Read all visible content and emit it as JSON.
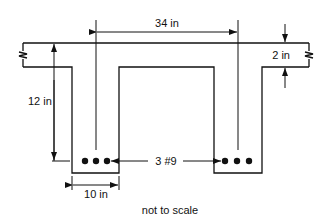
{
  "diagram": {
    "type": "T-beam cross-section",
    "labels": {
      "center_spacing": "34 in",
      "flange_thickness": "2 in",
      "total_depth": "12 in",
      "web_width": "10 in",
      "reinforcement": "3 #9",
      "note": "not to scale"
    },
    "colors": {
      "line": "#111111",
      "background": "#ffffff"
    }
  }
}
